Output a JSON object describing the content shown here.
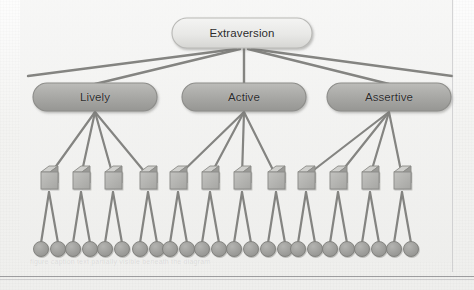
{
  "figure": {
    "type": "hierarchical-tree-diagram",
    "levels": 4,
    "colors": {
      "root_fill": "#e9e9e7",
      "root_stroke": "#b9b9b6",
      "facet_fill": "#a9a9a6",
      "facet_stroke": "#8d8d8a",
      "square_fill": "#b2b2af",
      "square_stroke": "#8a8a87",
      "circle_fill": "#9d9d9a",
      "circle_stroke": "#7e7e7b",
      "line": "#7b7b78",
      "text": "#2b2b2b",
      "background": "#f1f1ef"
    },
    "root": {
      "id": "root",
      "label": "Extraversion",
      "shape": "rounded-rectangle",
      "cx": 242,
      "cy": 33,
      "width": 140,
      "height": 30
    },
    "facets": [
      {
        "id": "facet-lively",
        "label": "Lively",
        "shape": "rounded-rectangle",
        "cx": 95,
        "cy": 97,
        "width": 124,
        "height": 28
      },
      {
        "id": "facet-active",
        "label": "Active",
        "shape": "rounded-rectangle",
        "cx": 244,
        "cy": 97,
        "width": 124,
        "height": 28
      },
      {
        "id": "facet-assertive",
        "label": "Assertive",
        "shape": "rounded-rectangle",
        "cx": 389,
        "cy": 97,
        "width": 124,
        "height": 28
      }
    ],
    "root_edges": {
      "count": 5,
      "description": "Five lines fan out from the base of the root node; the outermost two continue past the visible facets to the left and right edges of the panel.",
      "endpoints_x": [
        28,
        95,
        244,
        389,
        452
      ],
      "endpoints_y": [
        77,
        83,
        83,
        83,
        77
      ]
    },
    "item_squares": {
      "count": 12,
      "per_facet": 4,
      "shape": "square-3d",
      "size": 17,
      "cy": 184,
      "cx_values": [
        49,
        81,
        113,
        148,
        178,
        210,
        242,
        276,
        306,
        338,
        370,
        402
      ]
    },
    "indicator_circles": {
      "count": 24,
      "per_square": 2,
      "shape": "circle",
      "diameter": 15,
      "cy": 249,
      "cx_values": [
        41,
        58,
        73,
        90,
        105,
        122,
        140,
        157,
        170,
        187,
        202,
        219,
        234,
        251,
        268,
        285,
        298,
        315,
        330,
        347,
        362,
        379,
        394,
        411
      ]
    },
    "footer": {
      "ghost_text": "figure caption text partially visible beneath the diagram",
      "rule_visible": true
    }
  }
}
